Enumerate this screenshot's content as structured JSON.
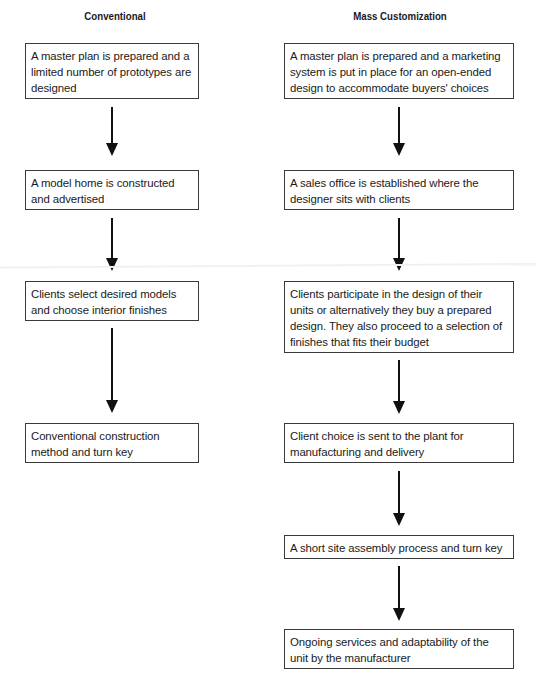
{
  "columns": [
    {
      "title": "Conventional",
      "steps": [
        "A master plan is prepared and a limited number of prototypes are designed",
        "A model home is constructed and advertised",
        "Clients select desired models and choose interior finishes",
        "Conventional construction method and turn key"
      ]
    },
    {
      "title": "Mass Customization",
      "steps": [
        "A master plan is prepared and a marketing system is put in place for an open-ended design to accommodate buyers' choices",
        "A sales office is established where the designer sits with clients",
        "Clients participate in the design of their units or alternatively they buy a prepared design. They also proceed to a selection of finishes that fits their budget",
        "Client choice is sent to the plant for manufacturing and delivery",
        "A short site assembly process and turn key",
        "Ongoing services and adaptability of the unit by the manufacturer"
      ]
    }
  ],
  "colors": {
    "line": "#111111",
    "border": "#3a3a3a",
    "text": "#1a1a1a"
  }
}
